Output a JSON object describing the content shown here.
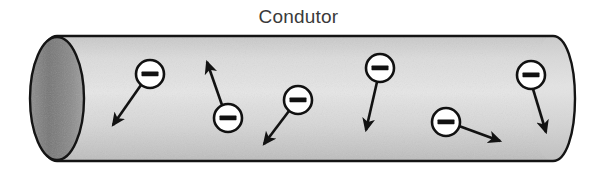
{
  "figure": {
    "title": "Condutor",
    "title_color": "#3a3a3a",
    "background_color": "#ffffff",
    "width": 597,
    "height": 177
  },
  "conductor": {
    "name": "conductor-cylinder",
    "outline_color": "#1a1a1a",
    "body_fill_light": "#e3e3e3",
    "body_fill_mid": "#cfcfcf",
    "body_fill_dark": "#b9b9b9",
    "cap_fill_dark": "#6e6e6e",
    "cap_fill_light": "#a8a8a8",
    "left": 30,
    "right": 575,
    "top": 36,
    "bottom": 161,
    "cap_rx": 27,
    "end_rx": 22
  },
  "electrons": [
    {
      "label": "–",
      "name": "electron-1",
      "cx": 150,
      "cy": 74,
      "r": 14,
      "arrow_x1": 141,
      "arrow_y1": 85,
      "arrow_x2": 113,
      "arrow_y2": 125,
      "circle_fill": "#ffffff",
      "stroke": "#111111"
    },
    {
      "label": "–",
      "name": "electron-2",
      "cx": 228,
      "cy": 118,
      "r": 14,
      "arrow_x1": 222,
      "arrow_y1": 105,
      "arrow_x2": 207,
      "arrow_y2": 62,
      "circle_fill": "#ffffff",
      "stroke": "#111111"
    },
    {
      "label": "–",
      "name": "electron-3",
      "cx": 298,
      "cy": 100,
      "r": 14,
      "arrow_x1": 289,
      "arrow_y1": 111,
      "arrow_x2": 264,
      "arrow_y2": 144,
      "circle_fill": "#ffffff",
      "stroke": "#111111"
    },
    {
      "label": "–",
      "name": "electron-4",
      "cx": 380,
      "cy": 68,
      "r": 14,
      "arrow_x1": 377,
      "arrow_y1": 82,
      "arrow_x2": 366,
      "arrow_y2": 130,
      "circle_fill": "#ffffff",
      "stroke": "#111111"
    },
    {
      "label": "–",
      "name": "electron-5",
      "cx": 446,
      "cy": 122,
      "r": 14,
      "arrow_x1": 459,
      "arrow_y1": 126,
      "arrow_x2": 500,
      "arrow_y2": 141,
      "circle_fill": "#ffffff",
      "stroke": "#111111"
    },
    {
      "label": "–",
      "name": "electron-6",
      "cx": 531,
      "cy": 75,
      "r": 14,
      "arrow_x1": 533,
      "arrow_y1": 89,
      "arrow_x2": 546,
      "arrow_y2": 132,
      "circle_fill": "#ffffff",
      "stroke": "#111111"
    }
  ]
}
